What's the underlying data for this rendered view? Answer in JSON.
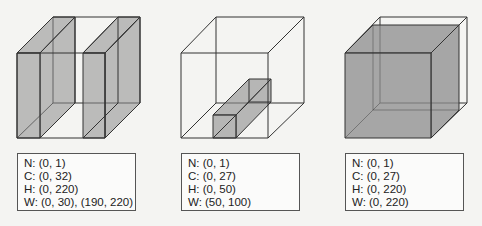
{
  "figure": {
    "colors": {
      "background": "#f4f4f2",
      "shade": "#8c8c8c",
      "line": "#333333"
    },
    "panels": [
      {
        "id": "panel-1",
        "description": "Two slabs spanning full height at left and right width ranges",
        "labels": {
          "n": "N: (0, 1)",
          "c": "C: (0, 32)",
          "h": "H: (0, 220)",
          "w": "W: (0, 30), (190, 220)"
        }
      },
      {
        "id": "panel-2",
        "description": "Small box at bottom covering partial channels",
        "labels": {
          "n": "N: (0, 1)",
          "c": "C: (0, 27)",
          "h": "H: (0, 50)",
          "w": "W: (50, 100)"
        }
      },
      {
        "id": "panel-3",
        "description": "Large box covering full H and W with partial channels",
        "labels": {
          "n": "N: (0, 1)",
          "c": "C: (0, 27)",
          "h": "H: (0, 220)",
          "w": "W: (0, 220)"
        }
      }
    ]
  }
}
